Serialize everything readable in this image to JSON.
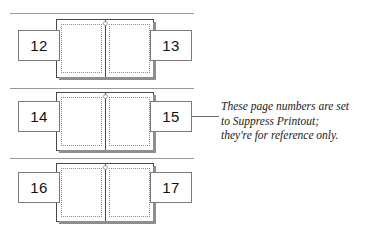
{
  "figure": {
    "type": "page-spread-diagram",
    "background_color": "#ffffff",
    "rule_color": "#9a9a9a",
    "spread_border_color": "#4a4a4a",
    "spread_shadow_color": "#8e8e8e",
    "guide_color": "#8c8c8c",
    "numbox_border_color": "#7b7b7b",
    "text_color": "#111111"
  },
  "rules": [
    {
      "name": "rule-top",
      "x": 10,
      "y": 13,
      "width": 184
    },
    {
      "name": "rule-middle",
      "x": 10,
      "y": 88,
      "width": 184
    },
    {
      "name": "rule-bottom",
      "x": 10,
      "y": 158,
      "width": 184
    }
  ],
  "spreads": [
    {
      "name": "spread-12-13",
      "x": 56,
      "y": 19,
      "width": 98,
      "height": 59,
      "left_page_number": "12",
      "right_page_number": "13",
      "left_box": {
        "x": 18,
        "y": 30,
        "width": 42,
        "height": 31
      },
      "right_box": {
        "x": 150,
        "y": 30,
        "width": 42,
        "height": 31
      }
    },
    {
      "name": "spread-14-15",
      "x": 56,
      "y": 92,
      "width": 98,
      "height": 59,
      "left_page_number": "14",
      "right_page_number": "15",
      "left_box": {
        "x": 18,
        "y": 101,
        "width": 42,
        "height": 31
      },
      "right_box": {
        "x": 150,
        "y": 101,
        "width": 42,
        "height": 31
      }
    },
    {
      "name": "spread-16-17",
      "x": 56,
      "y": 163,
      "width": 98,
      "height": 59,
      "left_page_number": "16",
      "right_page_number": "17",
      "left_box": {
        "x": 18,
        "y": 172,
        "width": 42,
        "height": 31
      },
      "right_box": {
        "x": 150,
        "y": 172,
        "width": 42,
        "height": 31
      }
    }
  ],
  "leader_line": {
    "name": "leader-line-to-note",
    "x": 192,
    "y": 116,
    "width": 27
  },
  "annotation": {
    "name": "suppress-printout-note",
    "x": 221,
    "y": 99,
    "lines": [
      "These page numbers are set",
      "to Suppress Printout;",
      "they're for reference only."
    ]
  }
}
